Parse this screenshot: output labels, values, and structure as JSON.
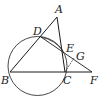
{
  "diagram": {
    "type": "geometry",
    "points": {
      "A": {
        "label": "A",
        "x": 57,
        "y": 17
      },
      "B": {
        "label": "B",
        "x": 10,
        "y": 72
      },
      "C": {
        "label": "C",
        "x": 65,
        "y": 72
      },
      "D": {
        "label": "D",
        "x": 41,
        "y": 37
      },
      "E": {
        "label": "E",
        "x": 63,
        "y": 51
      },
      "F": {
        "label": "F",
        "x": 92,
        "y": 72
      },
      "G": {
        "label": "G",
        "x": 74,
        "y": 58
      }
    },
    "circle": {
      "cx": 37.5,
      "cy": 66,
      "r": 29.5
    },
    "segments": [
      "AB",
      "AC",
      "BF",
      "DF",
      "DC",
      "CG"
    ],
    "labels": {
      "A": "A",
      "B": "B",
      "C": "C",
      "D": "D",
      "E": "E",
      "F": "F",
      "G": "G"
    }
  }
}
